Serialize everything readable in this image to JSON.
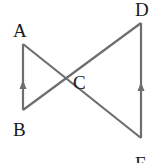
{
  "diagram": {
    "type": "geometry",
    "stroke_color": "#6e6e6e",
    "label_color": "#1a1a1a",
    "points": {
      "A": {
        "label": "A",
        "x": 23,
        "y": 44
      },
      "B": {
        "label": "B",
        "x": 23,
        "y": 110
      },
      "C": {
        "label": "C",
        "x": 65,
        "y": 80
      },
      "D": {
        "label": "D",
        "x": 141,
        "y": 23
      },
      "E": {
        "label": "E",
        "x": 141,
        "y": 138
      }
    },
    "segments": [
      {
        "from": "A",
        "to": "B",
        "arrow": "up"
      },
      {
        "from": "A",
        "to": "E"
      },
      {
        "from": "B",
        "to": "D"
      },
      {
        "from": "D",
        "to": "E",
        "arrow": "up"
      }
    ],
    "labels": {
      "A": "A",
      "B": "B",
      "C": "C",
      "D": "D",
      "E": "E"
    }
  }
}
